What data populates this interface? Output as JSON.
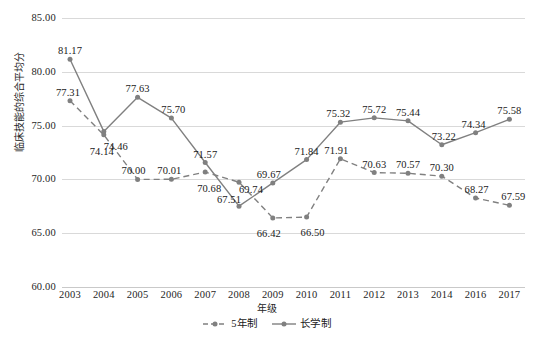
{
  "chart_data": {
    "type": "line",
    "title": "",
    "xlabel": "年级",
    "ylabel": "临床技能的综合平均分",
    "categories": [
      "2003",
      "2004",
      "2005",
      "2006",
      "2007",
      "2008",
      "2009",
      "2010",
      "2011",
      "2012",
      "2013",
      "2014",
      "2016",
      "2017"
    ],
    "ylim": [
      60.0,
      85.0
    ],
    "yticks": [
      "60.00",
      "65.00",
      "70.00",
      "75.00",
      "80.00",
      "85.00"
    ],
    "ytick_values": [
      60.0,
      65.0,
      70.0,
      75.0,
      80.0,
      85.0
    ],
    "grid": true,
    "legend_position": "bottom",
    "series": [
      {
        "name": "5年制",
        "style": "dashed",
        "marker": "circle",
        "color": "#808080",
        "values": [
          77.31,
          74.14,
          70.0,
          70.01,
          70.68,
          69.74,
          66.42,
          66.5,
          71.91,
          70.63,
          70.57,
          70.3,
          68.27,
          67.59
        ],
        "labels": [
          "77.31",
          "74.14",
          "70.00",
          "70.01",
          "70.68",
          "69.74",
          "66.42",
          "66.50",
          "71.91",
          "70.63",
          "70.57",
          "70.30",
          "68.27",
          "67.59"
        ]
      },
      {
        "name": "长学制",
        "style": "solid",
        "marker": "circle",
        "color": "#808080",
        "values": [
          81.17,
          74.46,
          77.63,
          75.7,
          71.57,
          67.51,
          69.67,
          71.84,
          75.32,
          75.72,
          75.44,
          73.22,
          74.34,
          75.58
        ],
        "labels": [
          "81.17",
          "74.46",
          "77.63",
          "75.70",
          "71.57",
          "67.51",
          "69.67",
          "71.84",
          "75.32",
          "75.72",
          "75.44",
          "73.22",
          "74.34",
          "75.58"
        ]
      }
    ]
  },
  "colors": {
    "series": "#808080",
    "gridline": "#d9d9d9",
    "text": "#1a1a1a"
  }
}
